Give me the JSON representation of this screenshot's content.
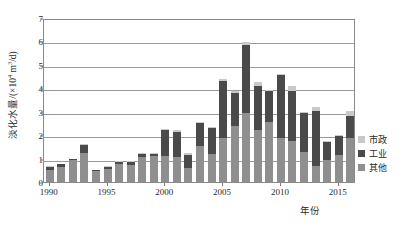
{
  "chart_data": {
    "type": "bar",
    "title": "",
    "subtitle": "",
    "xlabel": "年份",
    "ylabel": "淡化水量/(×10⁴ m³/d)",
    "ylabel_parts": {
      "prefix": "淡化水量/(×10",
      "exp1": "4",
      "mid": " m",
      "exp2": "3",
      "suffix": "/d)"
    },
    "stacked": true,
    "grid": true,
    "legend_position": "right",
    "ylim": [
      0,
      7
    ],
    "yticks": [
      0,
      1,
      2,
      3,
      4,
      5,
      6,
      7
    ],
    "ytick_labels": [
      "0",
      "1",
      "2",
      "3",
      "4",
      "5",
      "6",
      "7"
    ],
    "xticks": [
      1990,
      1995,
      2000,
      2005,
      2010,
      2015
    ],
    "xtick_labels": [
      "1990",
      "1995",
      "2000",
      "2005",
      "2010",
      "2015"
    ],
    "xlim": [
      1989.4,
      1989.4
    ],
    "categories": [
      "1990",
      "1991",
      "1992",
      "1993",
      "1994",
      "1995",
      "1996",
      "1997",
      "1998",
      "1999",
      "2000",
      "2001",
      "2002",
      "2003",
      "2004",
      "2005",
      "2006",
      "2007",
      "2008",
      "2009",
      "2010",
      "2011",
      "2012",
      "2013",
      "2014",
      "2015",
      "2016"
    ],
    "series": [
      {
        "name": "其他",
        "color": "#8f8f8f",
        "values": [
          0.5,
          0.62,
          0.92,
          1.25,
          0.45,
          0.55,
          0.75,
          0.72,
          1.05,
          1.1,
          1.1,
          1.05,
          0.6,
          1.55,
          1.2,
          1.9,
          2.4,
          2.95,
          2.2,
          2.55,
          1.9,
          1.75,
          1.3,
          0.7,
          0.95,
          1.15,
          1.9
        ]
      },
      {
        "name": "工业",
        "color": "#4a4a4a",
        "values": [
          0.13,
          0.13,
          0.05,
          0.33,
          0.05,
          0.1,
          0.1,
          0.14,
          0.13,
          0.1,
          1.1,
          1.1,
          0.55,
          0.95,
          1.1,
          2.4,
          1.4,
          2.9,
          1.9,
          1.35,
          2.65,
          2.15,
          1.65,
          2.35,
          0.75,
          0.8,
          0.9
        ]
      },
      {
        "name": "市政",
        "color": "#c9c9c9",
        "values": [
          0.04,
          0.03,
          0.03,
          0.04,
          0.03,
          0.03,
          0.03,
          0.04,
          0.05,
          0.05,
          0.05,
          0.08,
          0.07,
          0.08,
          0.07,
          0.08,
          0.08,
          0.13,
          0.17,
          0.03,
          0.07,
          0.2,
          0.05,
          0.15,
          0.05,
          0.05,
          0.25
        ]
      }
    ],
    "totals": [
      0.67,
      0.78,
      1.0,
      1.62,
      0.53,
      0.68,
      0.88,
      0.9,
      1.23,
      1.25,
      2.25,
      2.23,
      1.22,
      2.58,
      2.37,
      4.38,
      3.88,
      5.98,
      4.27,
      3.93,
      4.62,
      4.1,
      3.0,
      3.2,
      1.75,
      2.0,
      3.05
    ]
  },
  "legend": {
    "items": [
      {
        "label": "市政",
        "color": "#c9c9c9"
      },
      {
        "label": "工业",
        "color": "#4a4a4a"
      },
      {
        "label": "其他",
        "color": "#8f8f8f"
      }
    ]
  }
}
